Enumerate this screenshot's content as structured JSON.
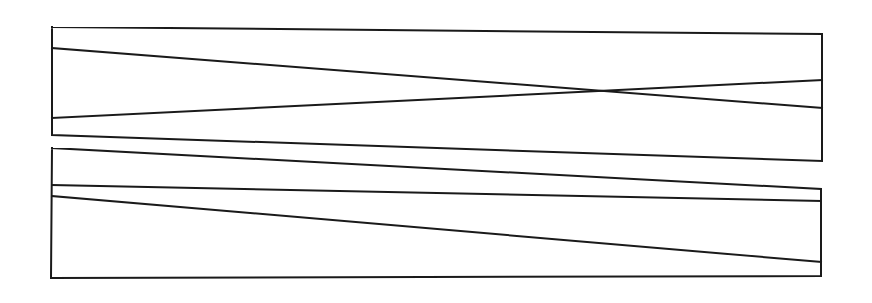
{
  "diagram": {
    "type": "line-drawing",
    "stroke_color": "#1a1a1a",
    "background": "#ffffff",
    "panels": [
      {
        "name": "top-panel",
        "outline": [
          [
            52,
            27
          ],
          [
            822,
            34
          ],
          [
            822,
            161
          ],
          [
            52,
            135
          ],
          [
            52,
            27
          ]
        ],
        "lines": [
          {
            "name": "descending-line",
            "from": [
              52,
              48
            ],
            "to": [
              822,
              108
            ]
          },
          {
            "name": "ascending-line",
            "from": [
              52,
              118
            ],
            "to": [
              822,
              80
            ]
          }
        ]
      },
      {
        "name": "bottom-panel",
        "outline": [
          [
            52,
            148
          ],
          [
            821,
            189
          ],
          [
            821,
            276
          ],
          [
            51,
            278
          ],
          [
            52,
            148
          ]
        ],
        "lines": [
          {
            "name": "upper-slope-line",
            "from": [
              52,
              185
            ],
            "to": [
              821,
              201
            ]
          },
          {
            "name": "lower-slope-line",
            "from": [
              52,
              196
            ],
            "to": [
              821,
              262
            ]
          }
        ]
      }
    ]
  }
}
